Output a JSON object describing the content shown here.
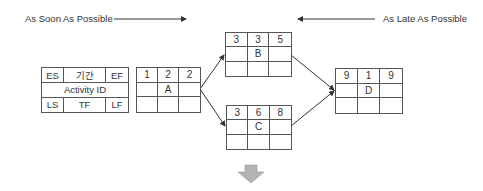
{
  "header": {
    "asap_label": "As Soon As Possible",
    "alap_label": "As Late As Possible"
  },
  "legend": {
    "cells": {
      "es": "ES",
      "duration": "기간",
      "ef": "EF",
      "activity_id": "Activity ID",
      "ls": "LS",
      "tf": "TF",
      "lf": "LF"
    }
  },
  "nodes": [
    {
      "id": "A",
      "es": "1",
      "duration": "2",
      "ef": "2",
      "ls": "",
      "tf": "",
      "lf": ""
    },
    {
      "id": "B",
      "es": "3",
      "duration": "3",
      "ef": "5",
      "ls": "",
      "tf": "",
      "lf": ""
    },
    {
      "id": "C",
      "es": "3",
      "duration": "6",
      "ef": "8",
      "ls": "",
      "tf": "",
      "lf": ""
    },
    {
      "id": "D",
      "es": "9",
      "duration": "1",
      "ef": "9",
      "ls": "",
      "tf": "",
      "lf": ""
    }
  ],
  "edges": [
    {
      "from": "A",
      "to": "B"
    },
    {
      "from": "A",
      "to": "C"
    },
    {
      "from": "B",
      "to": "D"
    },
    {
      "from": "C",
      "to": "D"
    }
  ],
  "colors": {
    "line": "#555555",
    "down_arrow": "#b3b3b3"
  }
}
